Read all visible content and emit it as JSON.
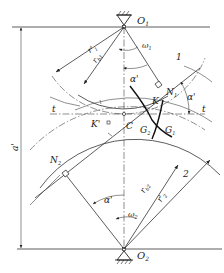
{
  "figure": {
    "labels": {
      "o1": "O",
      "o1_sub": "1",
      "o2": "O",
      "o2_sub": "2",
      "omega1": "ω",
      "omega1_sub": "1",
      "omega2": "ω",
      "omega2_sub": "2",
      "gear1": "1",
      "gear2": "2",
      "r1_prime": "r'",
      "r1_prime_sub": "1",
      "rb1": "r",
      "rb1_sub": "b1",
      "rb2": "r",
      "rb2_sub": "b2",
      "r2_prime": "r'",
      "r2_prime_sub": "2",
      "alpha_top": "α'",
      "alpha_right": "α'",
      "alpha_bottom": "α'",
      "n1": "N",
      "n1_sub": "1",
      "n2": "N",
      "n2_sub": "2",
      "k": "K",
      "k_prime": "K'",
      "c": "C",
      "g1": "G",
      "g1_sub": "1",
      "g2": "G",
      "g2_sub": "2",
      "t_left": "t",
      "t_right": "t",
      "center_distance": "a'"
    }
  }
}
